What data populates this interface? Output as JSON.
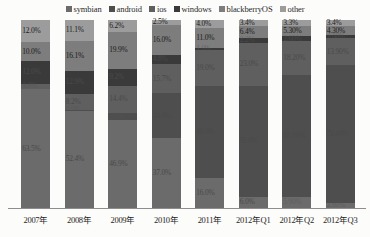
{
  "chart_data": {
    "type": "bar",
    "subtype": "stacked-bar-100-percent",
    "title": "",
    "xlabel": "",
    "ylabel": "",
    "ylim": [
      0,
      100
    ],
    "grid": false,
    "legend_position": "top-center",
    "categories": [
      "2007年",
      "2008年",
      "2009年",
      "2010年",
      "2011年",
      "2012年Q1",
      "2012年Q2",
      "2012年Q3"
    ],
    "series": [
      {
        "name": "symbian",
        "color": "#6b6b6b",
        "values": [
          63.5,
          52.4,
          46.9,
          37.0,
          16.0,
          6.0,
          5.9,
          2.6
        ],
        "labels": [
          "63.5%",
          "52.4%",
          "46.9%",
          "37.0%",
          "16.0%",
          "6.0%",
          "5.90%",
          "2.60%"
        ]
      },
      {
        "name": "android",
        "color": "#4e4e4e",
        "values": [
          0.0,
          0.5,
          3.9,
          24.0,
          49.0,
          59.0,
          65.1,
          72.4
        ],
        "labels": [
          "",
          "0.5%",
          "3.9%",
          "24.0%",
          "49.0%",
          "59.0%",
          "65.10%",
          "72.40%"
        ]
      },
      {
        "name": "ios",
        "color": "#5f5f5f",
        "values": [
          3.0,
          8.2,
          14.4,
          15.7,
          19.0,
          23.0,
          18.2,
          13.9
        ],
        "labels": [
          "3.0%",
          "8.2%",
          "14.4%",
          "15.7%",
          "19.0%",
          "23.0%",
          "18.20%",
          "13.90%"
        ]
      },
      {
        "name": "windows",
        "color": "#3a3a3a",
        "values": [
          12.0,
          12.9,
          9.2,
          4.8,
          1.0,
          2.2,
          2.6,
          2.0
        ],
        "labels": [
          "12.0%",
          "12.9%",
          "9.2%",
          "4.8%",
          "1.0%",
          "2.2%",
          "2.60%",
          "2.00%"
        ]
      },
      {
        "name": "blackberryOS",
        "color": "#7d7d7d",
        "values": [
          10.0,
          16.1,
          19.9,
          16.0,
          11.0,
          6.4,
          5.3,
          4.3
        ],
        "labels": [
          "10.0%",
          "16.1%",
          "19.9%",
          "16.0%",
          "11.0%",
          "6.4%",
          "5.30%",
          "4.30%"
        ]
      },
      {
        "name": "other",
        "color": "#9c9c9c",
        "values": [
          12.0,
          11.1,
          6.2,
          2.5,
          4.0,
          3.4,
          3.3,
          3.4
        ],
        "labels": [
          "12.0%",
          "11.1%",
          "6.2%",
          "2.5%",
          "4.0%",
          "3.4%",
          "3.3%",
          "3.4%"
        ]
      }
    ],
    "stack_order_top_to_bottom": [
      "other",
      "blackberryOS",
      "windows",
      "ios",
      "android",
      "symbian"
    ]
  },
  "legend": {
    "items": [
      {
        "label": "symbian",
        "color": "#6b6b6b"
      },
      {
        "label": "android",
        "color": "#4e4e4e"
      },
      {
        "label": "ios",
        "color": "#5f5f5f"
      },
      {
        "label": "windows",
        "color": "#3a3a3a"
      },
      {
        "label": "blackberryOS",
        "color": "#7d7d7d"
      },
      {
        "label": "other",
        "color": "#9c9c9c"
      }
    ]
  }
}
